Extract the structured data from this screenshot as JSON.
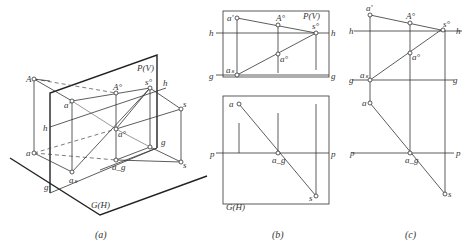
{
  "header_text": "",
  "panels": {
    "a": {
      "caption": "(a)",
      "plane_v_label": "P(V)",
      "plane_h_label": "G(H)",
      "labels": {
        "A": "A",
        "a_prime": "a'",
        "A_v": "A°",
        "s_v": "s°",
        "h_right": "h",
        "h_left": "h",
        "a_v": "a°",
        "a": "a",
        "s_upper": "s",
        "g_right": "g",
        "a_s": "aₛ",
        "a_g": "a_g",
        "s_lower": "s",
        "g_left": "g"
      }
    },
    "b": {
      "caption": "(b)",
      "plane_v_label": "P(V)",
      "plane_h_label": "G(H)",
      "labels": {
        "a_prime": "a'",
        "A_v": "A°",
        "s_v": "s°",
        "h_left": "h",
        "h_right": "h",
        "a_v": "a°",
        "g_left": "g",
        "a_s": "aₛ",
        "g_right": "g",
        "a": "a",
        "p_left": "p",
        "a_g": "a_g",
        "p_right": "p",
        "s": "s"
      }
    },
    "c": {
      "caption": "(c)",
      "labels": {
        "a_prime": "a'",
        "A_v": "A°",
        "s_v": "s°",
        "h_left": "h",
        "h_right": "h",
        "a_v": "a°",
        "g_left": "g",
        "a_s": "aₛ",
        "g_right": "g",
        "a": "a",
        "p_left": "p",
        "a_g": "a_g",
        "p_right": "p",
        "s": "s"
      }
    }
  }
}
